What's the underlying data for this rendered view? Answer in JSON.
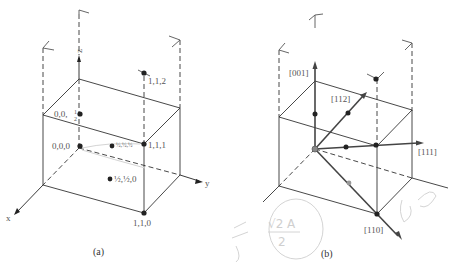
{
  "figure": {
    "panel_a": {
      "caption": "(a)",
      "axes": {
        "x": "x",
        "y": "y",
        "z": "z"
      },
      "points": [
        {
          "label": "0,0,1/2",
          "display": "0,0,",
          "frac": "1/2"
        },
        {
          "label": "1,1,2",
          "display": "1,1,2"
        },
        {
          "label": "0,0,0",
          "display": "0,0,0"
        },
        {
          "label": "1/2,1/2,1/2",
          "display": "½,½,½"
        },
        {
          "label": "1,1,1",
          "display": "1,1,1"
        },
        {
          "label": "1/2,1/2,0",
          "display": "½,½,0"
        },
        {
          "label": "1,1,0",
          "display": "1,1,0"
        }
      ]
    },
    "panel_b": {
      "caption": "(b)",
      "directions": [
        {
          "label": "[001]"
        },
        {
          "label": "[112]"
        },
        {
          "label": "[111]"
        },
        {
          "label": "[110]"
        }
      ],
      "handwriting": {
        "fraction_num": "√2 A",
        "fraction_den": "2",
        "left_scribble": "a/√2",
        "right_scribble": "ﾠ"
      }
    }
  }
}
